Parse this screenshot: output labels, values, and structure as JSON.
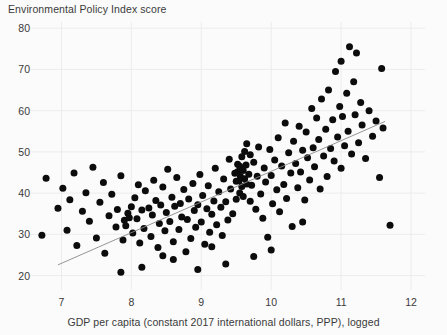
{
  "chart_data": {
    "type": "scatter",
    "title": "",
    "ylabel": "Environmental Policy Index score",
    "xlabel": "GDP per capita (constant 2017 international dollars, PPP), logged",
    "xlim": [
      6.55,
      12.2
    ],
    "ylim": [
      16.5,
      81.5
    ],
    "xticks": [
      7,
      8,
      9,
      10,
      11,
      12
    ],
    "yticks": [
      20,
      30,
      40,
      50,
      60,
      70,
      80
    ],
    "grid": true,
    "legend": "none",
    "marker": {
      "shape": "circle",
      "color": "#0c0c0c",
      "size": 7
    },
    "fit_line": {
      "type": "linear",
      "color": "#8a8a8a",
      "x_start": 6.95,
      "y_start": 22.6,
      "x_end": 11.63,
      "y_end": 57.4
    },
    "points": [
      [
        6.72,
        29.8
      ],
      [
        6.78,
        43.6
      ],
      [
        6.95,
        36.3
      ],
      [
        7.02,
        41.2
      ],
      [
        7.08,
        31.0
      ],
      [
        7.12,
        38.4
      ],
      [
        7.18,
        44.9
      ],
      [
        7.22,
        27.3
      ],
      [
        7.3,
        35.6
      ],
      [
        7.35,
        40.1
      ],
      [
        7.4,
        33.2
      ],
      [
        7.45,
        46.3
      ],
      [
        7.5,
        29.1
      ],
      [
        7.55,
        37.8
      ],
      [
        7.6,
        42.6
      ],
      [
        7.62,
        25.4
      ],
      [
        7.68,
        34.5
      ],
      [
        7.72,
        39.7
      ],
      [
        7.78,
        31.8
      ],
      [
        7.8,
        36.0
      ],
      [
        7.85,
        44.2
      ],
      [
        7.88,
        28.6
      ],
      [
        7.9,
        33.4
      ],
      [
        7.92,
        32.1
      ],
      [
        7.95,
        35.1
      ],
      [
        7.97,
        34.0
      ],
      [
        8.0,
        36.7
      ],
      [
        8.02,
        30.3
      ],
      [
        8.05,
        38.9
      ],
      [
        8.08,
        33.8
      ],
      [
        8.1,
        42.0
      ],
      [
        8.12,
        27.9
      ],
      [
        8.15,
        35.9
      ],
      [
        8.18,
        31.4
      ],
      [
        8.2,
        40.6
      ],
      [
        8.25,
        36.4
      ],
      [
        8.28,
        29.5
      ],
      [
        8.3,
        34.7
      ],
      [
        8.32,
        43.1
      ],
      [
        8.35,
        38.2
      ],
      [
        8.38,
        26.8
      ],
      [
        8.4,
        32.6
      ],
      [
        8.42,
        37.1
      ],
      [
        8.45,
        41.5
      ],
      [
        8.48,
        30.9
      ],
      [
        8.5,
        35.3
      ],
      [
        8.52,
        45.8
      ],
      [
        8.55,
        33.1
      ],
      [
        8.58,
        39.0
      ],
      [
        8.6,
        28.2
      ],
      [
        8.62,
        36.8
      ],
      [
        8.65,
        43.8
      ],
      [
        8.68,
        31.2
      ],
      [
        8.7,
        37.5
      ],
      [
        8.72,
        34.2
      ],
      [
        8.75,
        40.9
      ],
      [
        8.78,
        25.8
      ],
      [
        8.8,
        33.6
      ],
      [
        8.82,
        38.6
      ],
      [
        8.85,
        29.0
      ],
      [
        8.88,
        42.3
      ],
      [
        8.9,
        35.8
      ],
      [
        8.92,
        31.7
      ],
      [
        8.95,
        37.2
      ],
      [
        8.98,
        44.5
      ],
      [
        9.0,
        33.0
      ],
      [
        9.02,
        39.4
      ],
      [
        9.05,
        27.6
      ],
      [
        9.08,
        36.2
      ],
      [
        9.1,
        41.8
      ],
      [
        9.12,
        30.5
      ],
      [
        9.15,
        34.9
      ],
      [
        9.18,
        38.1
      ],
      [
        9.2,
        46.0
      ],
      [
        9.22,
        32.3
      ],
      [
        9.25,
        40.3
      ],
      [
        9.28,
        36.6
      ],
      [
        9.3,
        29.7
      ],
      [
        9.32,
        43.4
      ],
      [
        9.35,
        37.9
      ],
      [
        9.38,
        33.5
      ],
      [
        9.4,
        48.2
      ],
      [
        9.42,
        41.0
      ],
      [
        9.45,
        35.0
      ],
      [
        9.48,
        44.8
      ],
      [
        9.5,
        38.5
      ],
      [
        9.5,
        42.9
      ],
      [
        9.52,
        45.2
      ],
      [
        9.52,
        47.0
      ],
      [
        9.54,
        43.0
      ],
      [
        9.55,
        40.0
      ],
      [
        9.55,
        46.5
      ],
      [
        9.56,
        44.0
      ],
      [
        9.58,
        41.6
      ],
      [
        9.58,
        48.8
      ],
      [
        9.6,
        45.5
      ],
      [
        9.6,
        39.2
      ],
      [
        9.62,
        43.5
      ],
      [
        9.62,
        50.1
      ],
      [
        9.64,
        46.8
      ],
      [
        9.65,
        42.2
      ],
      [
        9.65,
        52.0
      ],
      [
        9.68,
        44.6
      ],
      [
        9.7,
        38.0
      ],
      [
        9.7,
        49.3
      ],
      [
        9.72,
        41.9
      ],
      [
        9.75,
        47.5
      ],
      [
        9.78,
        36.1
      ],
      [
        9.8,
        44.1
      ],
      [
        9.82,
        51.2
      ],
      [
        9.85,
        39.8
      ],
      [
        9.88,
        33.9
      ],
      [
        9.9,
        46.1
      ],
      [
        9.92,
        42.7
      ],
      [
        9.95,
        29.3
      ],
      [
        9.98,
        50.6
      ],
      [
        10.0,
        44.3
      ],
      [
        10.02,
        37.4
      ],
      [
        10.05,
        48.0
      ],
      [
        10.08,
        40.8
      ],
      [
        10.1,
        53.4
      ],
      [
        10.12,
        35.5
      ],
      [
        10.15,
        46.6
      ],
      [
        10.18,
        42.1
      ],
      [
        10.2,
        57.0
      ],
      [
        10.22,
        38.7
      ],
      [
        10.25,
        49.8
      ],
      [
        10.28,
        44.9
      ],
      [
        10.3,
        31.9
      ],
      [
        10.32,
        52.6
      ],
      [
        10.35,
        47.2
      ],
      [
        10.38,
        41.3
      ],
      [
        10.4,
        56.2
      ],
      [
        10.42,
        45.1
      ],
      [
        10.45,
        50.4
      ],
      [
        10.48,
        38.3
      ],
      [
        10.5,
        54.8
      ],
      [
        10.52,
        48.6
      ],
      [
        10.55,
        43.2
      ],
      [
        10.58,
        60.5
      ],
      [
        10.6,
        51.0
      ],
      [
        10.62,
        46.4
      ],
      [
        10.65,
        58.2
      ],
      [
        10.68,
        53.0
      ],
      [
        10.7,
        41.0
      ],
      [
        10.72,
        62.8
      ],
      [
        10.75,
        49.0
      ],
      [
        10.78,
        55.5
      ],
      [
        10.8,
        44.0
      ],
      [
        10.82,
        65.0
      ],
      [
        10.85,
        50.8
      ],
      [
        10.88,
        57.8
      ],
      [
        10.9,
        47.8
      ],
      [
        10.92,
        69.5
      ],
      [
        10.95,
        53.6
      ],
      [
        10.98,
        61.0
      ],
      [
        11.0,
        46.0
      ],
      [
        11.0,
        72.0
      ],
      [
        11.02,
        58.6
      ],
      [
        11.05,
        51.5
      ],
      [
        11.08,
        64.2
      ],
      [
        11.1,
        55.0
      ],
      [
        11.12,
        75.5
      ],
      [
        11.15,
        49.5
      ],
      [
        11.18,
        67.0
      ],
      [
        11.2,
        59.0
      ],
      [
        11.22,
        74.0
      ],
      [
        11.25,
        52.2
      ],
      [
        11.28,
        62.0
      ],
      [
        11.3,
        56.5
      ],
      [
        11.35,
        48.4
      ],
      [
        11.4,
        60.0
      ],
      [
        11.45,
        53.8
      ],
      [
        11.5,
        57.5
      ],
      [
        11.55,
        43.8
      ],
      [
        11.58,
        70.2
      ],
      [
        11.6,
        55.8
      ],
      [
        11.7,
        32.2
      ],
      [
        10.45,
        33.0
      ],
      [
        10.0,
        26.2
      ],
      [
        9.75,
        24.6
      ],
      [
        9.35,
        22.8
      ],
      [
        8.95,
        21.5
      ],
      [
        8.6,
        23.9
      ],
      [
        8.15,
        22.0
      ],
      [
        7.85,
        20.8
      ],
      [
        9.15,
        27.0
      ],
      [
        8.45,
        24.8
      ]
    ]
  }
}
